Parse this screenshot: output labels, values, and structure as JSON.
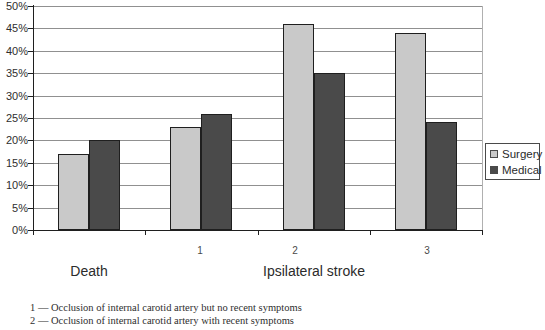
{
  "chart_data": {
    "type": "bar",
    "categories": [
      "Death",
      "1",
      "2",
      "3"
    ],
    "category_axis_groups": [
      "Death",
      "Ipsilateral stroke"
    ],
    "series": [
      {
        "name": "Surgery",
        "color": "#c9c9c9",
        "values": [
          17,
          23,
          46,
          44
        ]
      },
      {
        "name": "Medical",
        "color": "#4a4a4a",
        "values": [
          20,
          26,
          35,
          24
        ]
      }
    ],
    "title": "",
    "xlabel": "",
    "ylabel": "",
    "ylim": [
      0,
      50
    ],
    "ytick_step": 5,
    "ytick_labels": [
      "0%",
      "5%",
      "10%",
      "15%",
      "20%",
      "25%",
      "30%",
      "35%",
      "40%",
      "45%",
      "50%"
    ],
    "grid": true,
    "legend_position": "right"
  },
  "axis": {
    "sub_labels": [
      "1",
      "2",
      "3"
    ],
    "category_death": "Death",
    "category_ipsilateral": "Ipsilateral stroke"
  },
  "legend": {
    "items": [
      {
        "label": "Surgery",
        "color": "#c9c9c9"
      },
      {
        "label": "Medical",
        "color": "#4a4a4a"
      }
    ]
  },
  "footnotes": [
    "1 — Occlusion of internal carotid artery but no recent symptoms",
    "2 — Occlusion of internal carotid artery with recent symptoms"
  ]
}
